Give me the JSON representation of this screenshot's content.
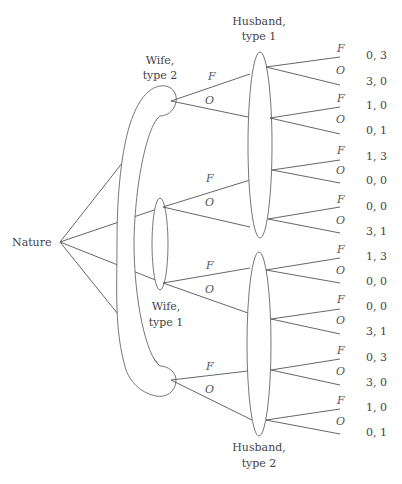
{
  "diagram": {
    "type": "extensive-form game tree",
    "root_label": "Nature",
    "labels": {
      "wife_type2": [
        "Wife,",
        "type 2"
      ],
      "wife_type1": [
        "Wife,",
        "type 1"
      ],
      "husband_type1": [
        "Husband,",
        "type 1"
      ],
      "husband_type2": [
        "Husband,",
        "type 2"
      ]
    },
    "actions": {
      "f": "F",
      "o": "O"
    },
    "wife_branches": [
      {
        "f": "F",
        "o": "O"
      },
      {
        "f": "F",
        "o": "O"
      },
      {
        "f": "F",
        "o": "O"
      },
      {
        "f": "F",
        "o": "O"
      }
    ],
    "husband_branches": [
      {
        "f": "F",
        "o": "O",
        "payoff_f": "0, 3",
        "payoff_o": "3, 0"
      },
      {
        "f": "F",
        "o": "O",
        "payoff_f": "1, 0",
        "payoff_o": "0, 1"
      },
      {
        "f": "F",
        "o": "O",
        "payoff_f": "1, 3",
        "payoff_o": "0, 0"
      },
      {
        "f": "F",
        "o": "O",
        "payoff_f": "0, 0",
        "payoff_o": "3, 1"
      },
      {
        "f": "F",
        "o": "O",
        "payoff_f": "1, 3",
        "payoff_o": "0, 0"
      },
      {
        "f": "F",
        "o": "O",
        "payoff_f": "0, 0",
        "payoff_o": "3, 1"
      },
      {
        "f": "F",
        "o": "O",
        "payoff_f": "0, 3",
        "payoff_o": "3, 0"
      },
      {
        "f": "F",
        "o": "O",
        "payoff_f": "1, 0",
        "payoff_o": "0, 1"
      }
    ]
  }
}
